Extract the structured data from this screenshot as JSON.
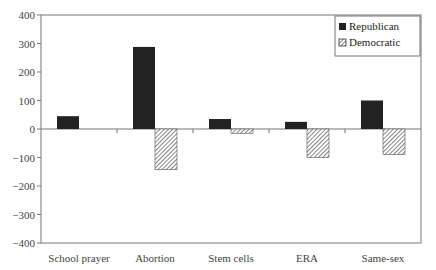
{
  "chart_data": {
    "type": "bar",
    "title": "",
    "xlabel": "",
    "ylabel": "",
    "categories": [
      "School prayer",
      "Abortion",
      "Stem cells",
      "ERA",
      "Same-sex"
    ],
    "series": [
      {
        "name": "Republican",
        "values": [
          45,
          288,
          35,
          25,
          100
        ],
        "color": "#222222",
        "pattern": "solid"
      },
      {
        "name": "Democratic",
        "values": [
          0,
          -143,
          -15,
          -100,
          -90
        ],
        "color": "#ffffff",
        "pattern": "diagonal-hatch"
      }
    ],
    "ylim": [
      -400,
      400
    ],
    "yticks": [
      400,
      300,
      200,
      100,
      0,
      -100,
      -200,
      -300,
      -400
    ],
    "ytick_labels": [
      "400",
      "300",
      "200",
      "100",
      "0",
      "−100",
      "−200",
      "−300",
      "−400"
    ],
    "grid": false,
    "legend_position": "top-right inside"
  },
  "legend": {
    "items": [
      {
        "label": "Republican"
      },
      {
        "label": "Democratic"
      }
    ]
  }
}
